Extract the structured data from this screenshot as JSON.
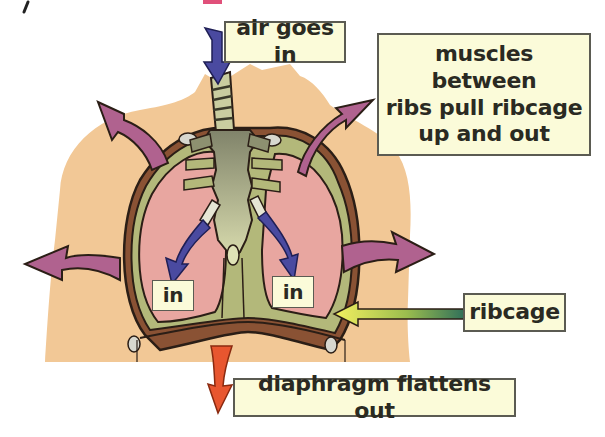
{
  "diagram": {
    "colors": {
      "background": "#ffffff",
      "body_skin": "#f2c896",
      "lung_tissue": "#e8a6a0",
      "ribcage_green": "#b3b87a",
      "ribcage_brown": "#8a5234",
      "trachea_bronchi": "#8d9070",
      "air_arrow_blue": "#4a4aa0",
      "movement_arrow_purple": "#b0628f",
      "diaphragm_arrow_orange": "#e8562f",
      "ribcage_pointer_gradient_start": "#f4f060",
      "ribcage_pointer_gradient_end": "#2e6e5a",
      "label_fill": "#fbfbd9",
      "label_border": "#5b5b52",
      "text": "#2a2a22",
      "top_pink_mark": "#e0507a"
    },
    "labels": {
      "air": "air goes in",
      "muscles": {
        "lines": [
          "muscles between",
          "ribs pull ribcage",
          "up and out"
        ]
      },
      "ribcage": "ribcage",
      "diaphragm": "diaphragm flattens out",
      "in_left": "in",
      "in_right": "in"
    },
    "arrows": [
      {
        "name": "air-inflow",
        "color": "blue",
        "direction": "down into trachea"
      },
      {
        "name": "air-left-bronchus",
        "color": "blue",
        "direction": "down-left into left lung"
      },
      {
        "name": "air-right-bronchus",
        "color": "blue",
        "direction": "down-right into right lung"
      },
      {
        "name": "ribcage-up-left",
        "color": "purple",
        "direction": "up and out left"
      },
      {
        "name": "ribcage-up-right",
        "color": "purple",
        "direction": "up and out right"
      },
      {
        "name": "ribcage-out-left",
        "color": "purple",
        "direction": "out left"
      },
      {
        "name": "ribcage-out-right",
        "color": "purple",
        "direction": "out right"
      },
      {
        "name": "diaphragm-down",
        "color": "orange",
        "direction": "down"
      },
      {
        "name": "ribcage-pointer",
        "color": "yellow-green",
        "direction": "left to ribcage"
      }
    ]
  }
}
